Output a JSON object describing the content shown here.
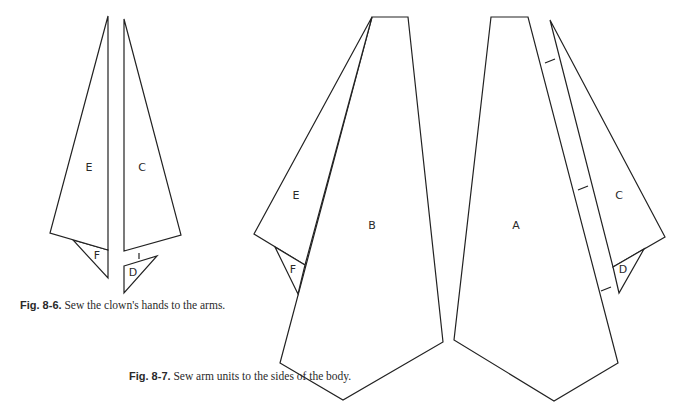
{
  "figures": {
    "fig_8_6": {
      "caption_label": "Fig. 8-6.",
      "caption_text": " Sew the clown's hands to the arms.",
      "pieces": {
        "E": "E",
        "F": "F",
        "C": "C",
        "D": "D"
      }
    },
    "fig_8_7": {
      "caption_label": "Fig. 8-7.",
      "caption_text": " Sew arm units to the sides of the body.",
      "pieces": {
        "E": "E",
        "F": "F",
        "B": "B",
        "A": "A",
        "C": "C",
        "D": "D"
      }
    }
  },
  "colors": {
    "line": "#222222",
    "background": "#ffffff",
    "text": "#2a2a2a"
  }
}
